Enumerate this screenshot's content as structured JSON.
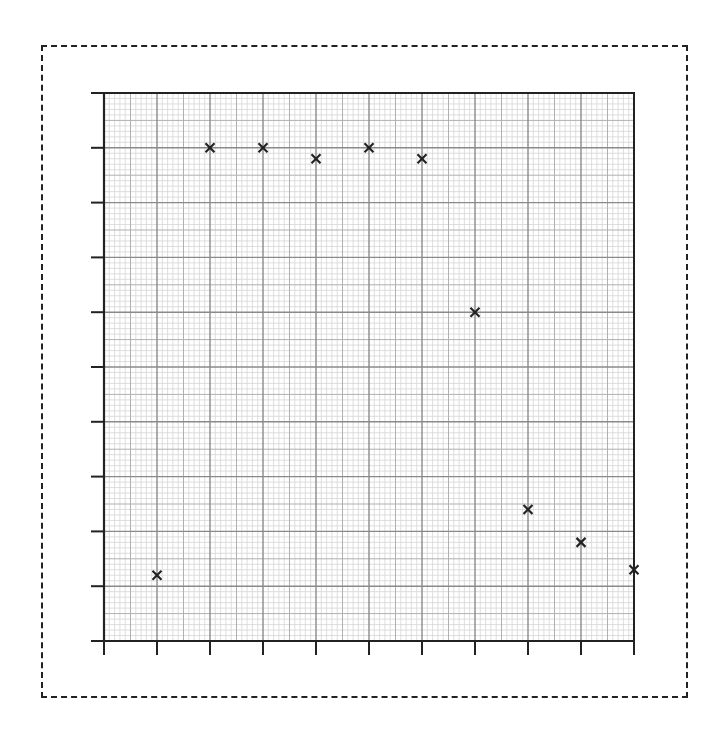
{
  "chart_data": {
    "type": "scatter",
    "title": "",
    "xlabel": "",
    "ylabel": "",
    "xlim": [
      0,
      10
    ],
    "ylim": [
      0,
      10
    ],
    "grid": true,
    "grid_style": "graph-paper: major every 1 unit, medium every 0.5, minor every 0.1",
    "x_ticks": [
      0,
      1,
      2,
      3,
      4,
      5,
      6,
      7,
      8,
      9,
      10
    ],
    "y_ticks": [
      0,
      1,
      2,
      3,
      4,
      5,
      6,
      7,
      8,
      9,
      10
    ],
    "tick_labels_shown": false,
    "marker": "x",
    "legend": [],
    "series": [
      {
        "name": "points",
        "x": [
          1,
          2,
          3,
          4,
          5,
          6,
          7,
          8,
          9,
          10
        ],
        "y": [
          1.2,
          9.0,
          9.0,
          8.8,
          9.0,
          8.8,
          6.0,
          2.4,
          1.8,
          1.3
        ]
      }
    ]
  },
  "style": {
    "major_line_color": "#8a8a8a",
    "medium_line_color": "#b0b0b0",
    "minor_line_color": "#d6d6d6",
    "axis_color": "#222222",
    "marker_color": "#222222",
    "frame_border": "dashed"
  }
}
